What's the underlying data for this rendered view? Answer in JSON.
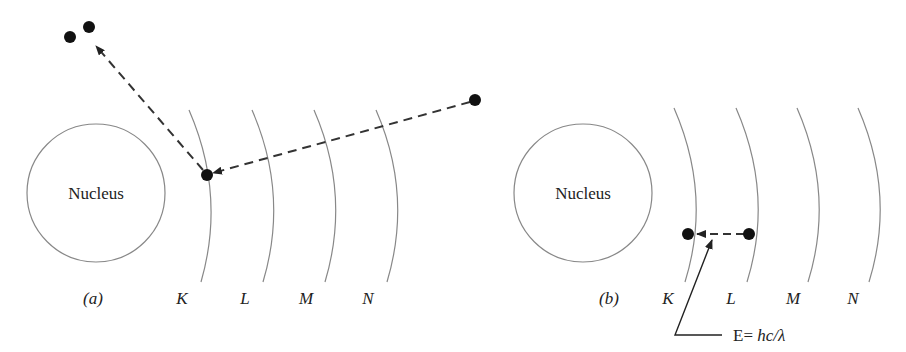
{
  "panels": [
    {
      "id": "a",
      "caption": "(a)",
      "nucleus_label": "Nucleus",
      "shells": [
        "K",
        "L",
        "M",
        "N"
      ],
      "description": "Incoming particle ejects K-shell electron"
    },
    {
      "id": "b",
      "caption": "(b)",
      "nucleus_label": "Nucleus",
      "shells": [
        "K",
        "L",
        "M",
        "N"
      ],
      "photon_label_prefix": "E= ",
      "photon_label_formula": "hc/λ",
      "description": "L-shell electron drops to K-shell emitting photon"
    }
  ],
  "colors": {
    "line": "#888888",
    "dashed": "#333333",
    "electron": "#111111",
    "text": "#222222"
  }
}
